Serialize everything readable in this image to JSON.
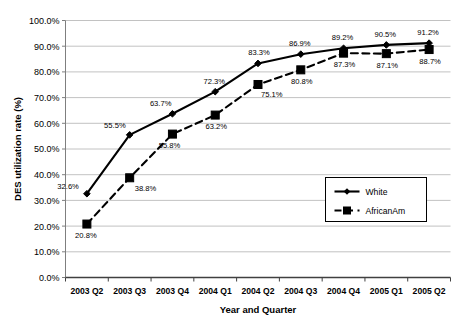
{
  "chart_data": {
    "type": "line",
    "title": "",
    "xlabel": "Year and Quarter",
    "ylabel": "DES utilization rate (%)",
    "categories": [
      "2003 Q2",
      "2003 Q3",
      "2003 Q4",
      "2004 Q1",
      "2004 Q2",
      "2004 Q3",
      "2004 Q4",
      "2005 Q1",
      "2005 Q2"
    ],
    "ylim": [
      0,
      100
    ],
    "ytick_labels": [
      "0.0%",
      "10.0%",
      "20.0%",
      "30.0%",
      "40.0%",
      "50.0%",
      "60.0%",
      "70.0%",
      "80.0%",
      "90.0%",
      "100.0%"
    ],
    "ytick_values": [
      0,
      10,
      20,
      30,
      40,
      50,
      60,
      70,
      80,
      90,
      100
    ],
    "grid": true,
    "legend_position": "inside-right-lower",
    "series": [
      {
        "name": "White",
        "marker": "diamond",
        "line_style": "solid",
        "color": "#000000",
        "values": [
          32.6,
          55.5,
          63.7,
          72.3,
          83.3,
          86.9,
          89.2,
          90.5,
          91.2
        ],
        "data_labels": [
          "32.6%",
          "55.5%",
          "63.7%",
          "72.3%",
          "83.3%",
          "86.9%",
          "89.2%",
          "90.5%",
          "91.2%"
        ]
      },
      {
        "name": "AfricanAm",
        "marker": "square",
        "line_style": "dashed",
        "color": "#000000",
        "values": [
          20.8,
          38.8,
          55.8,
          63.2,
          75.1,
          80.8,
          87.3,
          87.1,
          88.7
        ],
        "data_labels": [
          "20.8%",
          "38.8%",
          "55.8%",
          "63.2%",
          "75.1%",
          "80.8%",
          "87.3%",
          "87.1%",
          "88.7%"
        ]
      }
    ]
  }
}
